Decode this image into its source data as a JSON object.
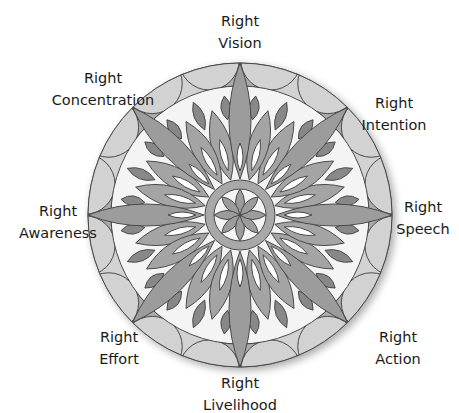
{
  "diagram": {
    "center": {
      "x": 240,
      "y": 215
    },
    "outer_radius": 152,
    "ring_inner_radius": 129,
    "hub_outer_radius": 35,
    "hub_inner_radius": 26,
    "colors": {
      "ring": "#d2d2d2",
      "ring_dark": "#aaaaaa",
      "field": "#f4f4f4",
      "petal": "#9c9c9c",
      "petal_medium": "#a4a4a4",
      "leaf": "#888888",
      "hub": "#a8a8a8",
      "stroke": "#4a4a4a",
      "text": "#1a1a1a"
    }
  },
  "labels": [
    {
      "id": "vision",
      "line1": "Right",
      "line2": "Vision",
      "x": 240,
      "y": 10
    },
    {
      "id": "intention",
      "line1": "Right",
      "line2": "Intention",
      "x": 394,
      "y": 92
    },
    {
      "id": "speech",
      "line1": "Right",
      "line2": "Speech",
      "x": 423,
      "y": 196
    },
    {
      "id": "action",
      "line1": "Right",
      "line2": "Action",
      "x": 398,
      "y": 326
    },
    {
      "id": "livelihood",
      "line1": "Right",
      "line2": "Livelihood",
      "x": 240,
      "y": 372
    },
    {
      "id": "effort",
      "line1": "Right",
      "line2": "Effort",
      "x": 119,
      "y": 326
    },
    {
      "id": "awareness",
      "line1": "Right",
      "line2": "Awareness",
      "x": 58,
      "y": 200
    },
    {
      "id": "concentration",
      "line1": "Right",
      "line2": "Concentration",
      "x": 103,
      "y": 67
    }
  ]
}
